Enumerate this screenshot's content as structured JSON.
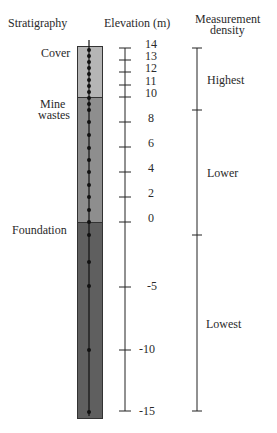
{
  "headers": {
    "stratigraphy": "Stratigraphy",
    "elevation": "Elevation (m)",
    "density_line1": "Measurement",
    "density_line2": "density"
  },
  "layers": [
    {
      "name": "Cover",
      "top_m": 14,
      "bottom_m": 10,
      "color": "#b5b5b5"
    },
    {
      "name_line1": "Mine",
      "name_line2": "wastes",
      "top_m": 10,
      "bottom_m": 0,
      "color": "#8e8e8e"
    },
    {
      "name": "Foundation",
      "top_m": 0,
      "bottom_m": -15.5,
      "color": "#5f5f5f"
    }
  ],
  "elevation_ticks": [
    "14",
    "13",
    "12",
    "11",
    "10",
    "8",
    "6",
    "4",
    "2",
    "0",
    "-5",
    "-10",
    "-15"
  ],
  "density_zones": [
    {
      "label": "Highest"
    },
    {
      "label": "Lower"
    },
    {
      "label": "Lowest"
    }
  ]
}
